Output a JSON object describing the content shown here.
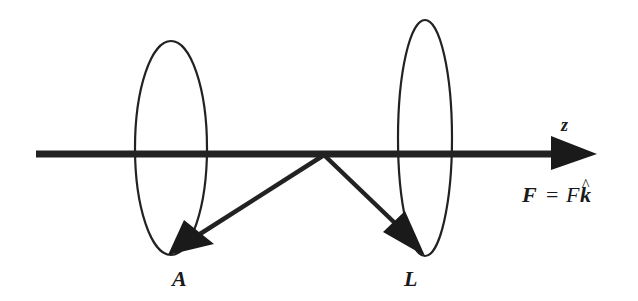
{
  "figure": {
    "axis": {
      "label": "z"
    },
    "force": {
      "lhs": "F",
      "equals": "=",
      "rhs_scalar": "F",
      "rhs_unit": "k",
      "unit_hat": "^"
    },
    "vectors": [
      {
        "id": "A",
        "label": "A"
      },
      {
        "id": "L",
        "label": "L"
      }
    ],
    "colors": {
      "stroke": "#222222",
      "background": "#ffffff"
    }
  }
}
